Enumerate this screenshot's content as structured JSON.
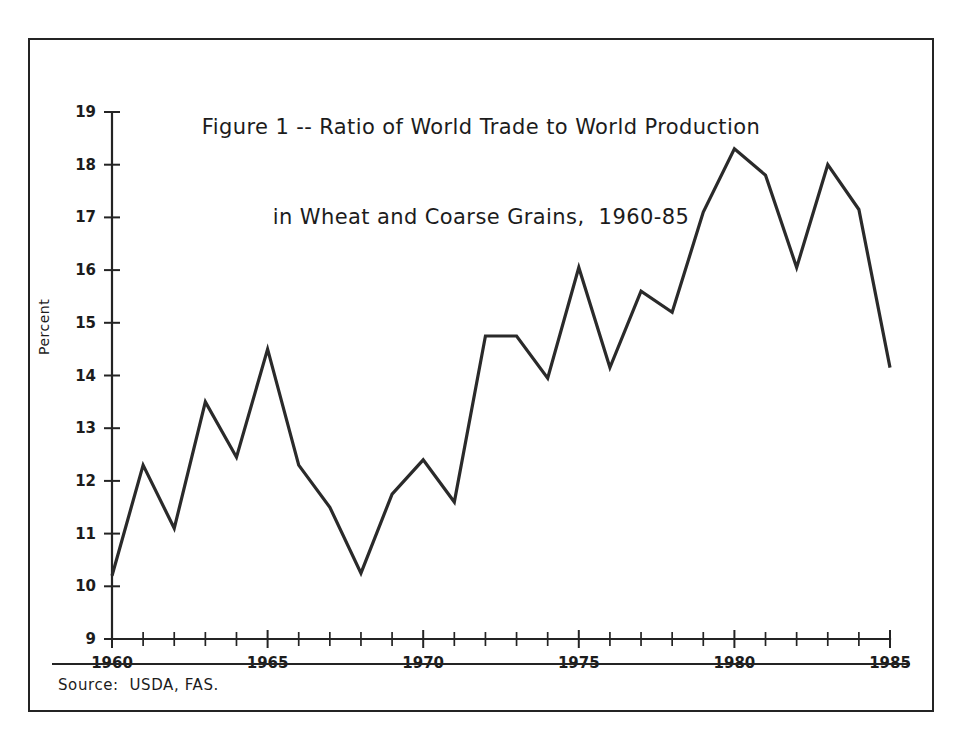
{
  "figure": {
    "title_line_1": "Figure 1 -- Ratio of World Trade to World Production",
    "title_line_2": "in Wheat and Coarse Grains,  1960-85",
    "source_note": "Source:  USDA, FAS.",
    "y_axis_title": "Percent",
    "frame_color": "#242424",
    "line_color": "#2a2a2a",
    "background_color": "#ffffff"
  },
  "chart_data": {
    "type": "line",
    "title": "Figure 1 -- Ratio of World Trade to World Production in Wheat and Coarse Grains, 1960-85",
    "xlabel": "",
    "ylabel": "Percent",
    "xlim": [
      1960,
      1985
    ],
    "ylim": [
      9,
      19
    ],
    "grid": false,
    "legend": "none",
    "x_tick_interval": 1,
    "x_labeled_ticks": [
      "1960",
      "1965",
      "1970",
      "1975",
      "1980",
      "1985"
    ],
    "y_tick_labels": [
      "9",
      "10",
      "11",
      "12",
      "13",
      "14",
      "15",
      "16",
      "17",
      "18",
      "19"
    ],
    "x": [
      1960,
      1961,
      1962,
      1963,
      1964,
      1965,
      1966,
      1967,
      1968,
      1969,
      1970,
      1971,
      1972,
      1973,
      1974,
      1975,
      1976,
      1977,
      1978,
      1979,
      1980,
      1981,
      1982,
      1983,
      1984,
      1985
    ],
    "series": [
      {
        "name": "Ratio of world trade to world production",
        "units": "percent",
        "values": [
          10.2,
          12.3,
          11.1,
          13.5,
          12.45,
          14.5,
          12.3,
          11.5,
          10.25,
          11.75,
          12.4,
          11.6,
          14.75,
          14.75,
          13.95,
          16.05,
          14.15,
          15.6,
          15.2,
          17.1,
          18.3,
          17.8,
          16.05,
          18.0,
          17.15,
          14.15
        ]
      }
    ],
    "source": "USDA, FAS."
  }
}
